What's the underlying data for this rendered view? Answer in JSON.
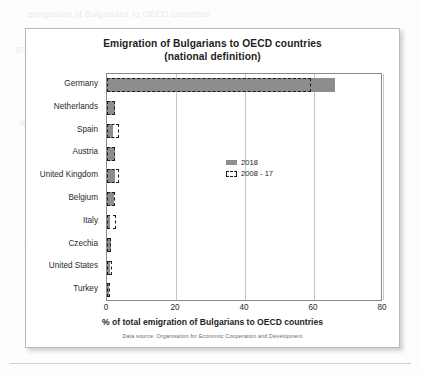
{
  "figure": {
    "title_line1": "Emigration of Bulgarians to OECD countries",
    "title_line2": "(national definition)",
    "source_note": "Data source: Organisation for Economic Cooperation and Development"
  },
  "legend": {
    "items": [
      {
        "label": "2018",
        "style": "solid",
        "color": "#8d8d8d"
      },
      {
        "label": "2008 - 17",
        "style": "dashed",
        "color": "#1a1a1a"
      }
    ]
  },
  "chart_data": {
    "type": "bar",
    "orientation": "horizontal",
    "title": "Emigration of Bulgarians to OECD countries (national definition)",
    "xlabel": "% of total emigration of Bulgarians to OECD countries",
    "ylabel": "",
    "xlim": [
      0,
      80
    ],
    "xticks": [
      0,
      20,
      40,
      60,
      80
    ],
    "grid": true,
    "legend_position": "center-right",
    "categories": [
      "Germany",
      "Netherlands",
      "Spain",
      "Austria",
      "United Kingdom",
      "Belgium",
      "Italy",
      "Czechia",
      "United States",
      "Turkey"
    ],
    "series": [
      {
        "name": "2018",
        "color": "#8d8d8d",
        "style": "solid",
        "values": [
          66.0,
          2.3,
          1.7,
          2.3,
          2.4,
          2.0,
          1.0,
          1.3,
          0.8,
          0.6
        ]
      },
      {
        "name": "2008 - 17",
        "color": "#1a1a1a",
        "style": "dashed-outline",
        "values": [
          59.0,
          2.3,
          3.5,
          2.4,
          3.4,
          2.2,
          2.5,
          1.1,
          1.5,
          0.7
        ]
      }
    ]
  },
  "background_text": {
    "lines": [
      "emigration of Bulgarians to OECD countries",
      "population and the number of",
      "in the total number of emigrants",
      "data on the main host countries",
      "relative share of emigrants",
      "figures show that the largest",
      "remains the main destination",
      "of the total emigration flow"
    ]
  }
}
